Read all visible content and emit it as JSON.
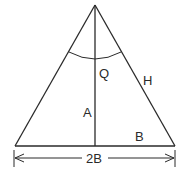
{
  "diagram": {
    "type": "isosceles-triangle-geometry",
    "labels": {
      "angle": "Q",
      "hypotenuse": "H",
      "height": "A",
      "half_base": "B",
      "base_dimension": "2B"
    },
    "colors": {
      "stroke": "#2a2a2a",
      "background": "#ffffff"
    }
  }
}
